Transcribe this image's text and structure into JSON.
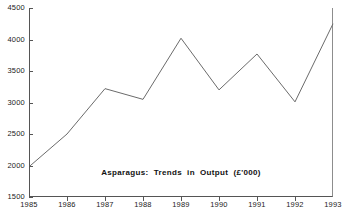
{
  "chart_data": {
    "type": "line",
    "title": "Asparagus:  Trends  in  Output  (£'000)",
    "xlabel": "",
    "ylabel": "",
    "grid": false,
    "legend": false,
    "categories": [
      "1985",
      "1986",
      "1987",
      "1988",
      "1989",
      "1990",
      "1991",
      "1992",
      "1993"
    ],
    "values": [
      1980,
      2500,
      3220,
      3050,
      4020,
      3200,
      3770,
      3010,
      4250
    ],
    "series": [
      {
        "name": "Asparagus output",
        "values": [
          1980,
          2500,
          3220,
          3050,
          4020,
          3200,
          3770,
          3010,
          4250
        ]
      }
    ],
    "xlim": [
      1985,
      1993
    ],
    "ylim": [
      1500,
      4500
    ],
    "y_ticks": [
      1500,
      2000,
      2500,
      3000,
      3500,
      4000,
      4500
    ],
    "y_tick_labels": [
      "1500",
      "2000",
      "2500",
      "3000",
      "3500",
      "4000",
      "4500"
    ],
    "x_ticks": [
      1985,
      1986,
      1987,
      1988,
      1989,
      1990,
      1991,
      1992,
      1993
    ],
    "x_tick_labels": [
      "1985",
      "1986",
      "1987",
      "1988",
      "1989",
      "1990",
      "1991",
      "1992",
      "1993"
    ],
    "units": "£'000",
    "line_color": "#6b6b6b",
    "axis_color": "#555555",
    "background_color": "#ffffff"
  }
}
